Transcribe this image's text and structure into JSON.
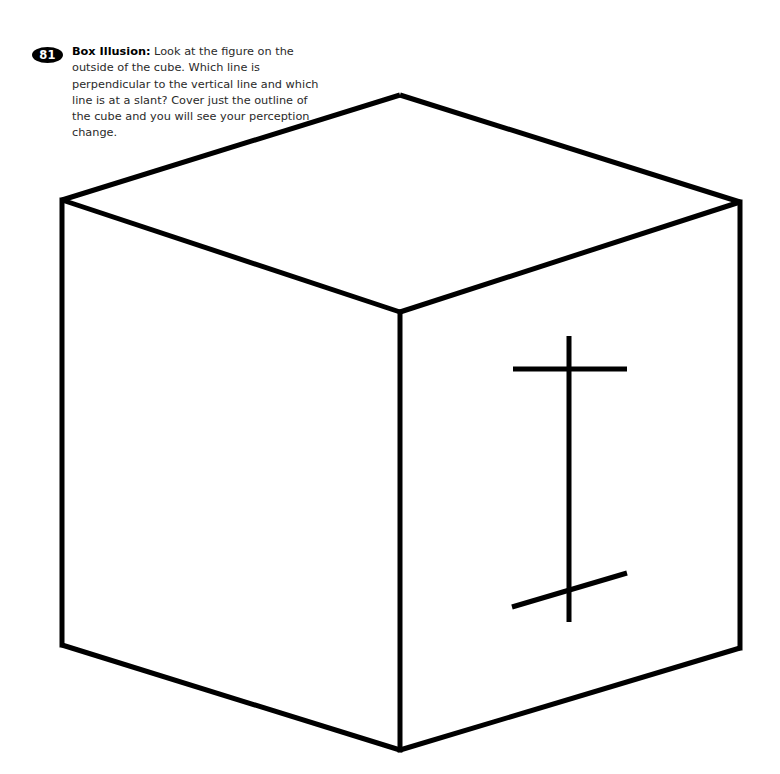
{
  "page": {
    "width": 780,
    "height": 774,
    "background": "#ffffff",
    "ink": "#000000"
  },
  "caption": {
    "badge_number": "81",
    "title": "Box Illusion:",
    "body": " Look at the figure on the outside of the cube. Which line is perpendicular to the vertical line and which line is at a slant? Cover just the outline of the cube and you will see your perception change."
  },
  "figure": {
    "name": "box-illusion-cube",
    "stroke_color": "#000000",
    "cube_stroke_width": 5,
    "mark_stroke_width": 5,
    "vertices": {
      "top": [
        400,
        95
      ],
      "left": [
        62,
        200
      ],
      "right": [
        740,
        202
      ],
      "center": [
        400,
        312
      ],
      "bottom_left": [
        62,
        645
      ],
      "bottom_right": [
        740,
        648
      ],
      "bottom_center": [
        400,
        750
      ]
    },
    "edges": [
      {
        "name": "top-left-edge",
        "from": [
          62,
          200
        ],
        "to": [
          400,
          95
        ]
      },
      {
        "name": "top-right-edge",
        "from": [
          400,
          95
        ],
        "to": [
          740,
          202
        ]
      },
      {
        "name": "center-left-edge",
        "from": [
          62,
          200
        ],
        "to": [
          400,
          312
        ]
      },
      {
        "name": "center-right-edge",
        "from": [
          400,
          312
        ],
        "to": [
          740,
          202
        ]
      },
      {
        "name": "left-vertical-edge",
        "from": [
          62,
          200
        ],
        "to": [
          62,
          645
        ]
      },
      {
        "name": "center-vertical-edge",
        "from": [
          400,
          312
        ],
        "to": [
          400,
          750
        ]
      },
      {
        "name": "right-vertical-edge",
        "from": [
          740,
          202
        ],
        "to": [
          740,
          648
        ]
      },
      {
        "name": "bottom-left-edge",
        "from": [
          62,
          645
        ],
        "to": [
          400,
          750
        ]
      },
      {
        "name": "bottom-right-edge",
        "from": [
          400,
          750
        ],
        "to": [
          740,
          648
        ]
      }
    ],
    "marks": [
      {
        "name": "vertical-line",
        "from": [
          569,
          336
        ],
        "to": [
          569,
          622
        ]
      },
      {
        "name": "perpendicular-line",
        "from": [
          513,
          369
        ],
        "to": [
          627,
          369
        ]
      },
      {
        "name": "slanted-line",
        "from": [
          512,
          607
        ],
        "to": [
          627,
          573
        ]
      }
    ]
  }
}
